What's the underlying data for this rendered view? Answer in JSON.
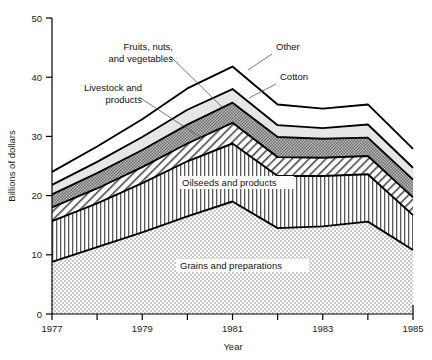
{
  "chart_data": {
    "type": "area",
    "stacked": true,
    "title": "",
    "subtitle": "",
    "xlabel": "Year",
    "ylabel": "Billions of dollars",
    "xlim": [
      1977,
      1985
    ],
    "ylim": [
      0,
      50
    ],
    "ytick_labels": [
      "0",
      "10",
      "20",
      "30",
      "40",
      "50"
    ],
    "ytick_values": [
      0,
      10,
      20,
      30,
      40,
      50
    ],
    "xtick_labels": [
      "1977",
      "",
      "1979",
      "",
      "1981",
      "",
      "1983",
      "",
      "1985"
    ],
    "xtick_values": [
      1977,
      1978,
      1979,
      1980,
      1981,
      1982,
      1983,
      1984,
      1985
    ],
    "xtick_labels_shown": [
      "1977",
      "1979",
      "1981",
      "1983",
      "1985"
    ],
    "grid": false,
    "legend": "inline-annotations",
    "x": [
      1977,
      1978,
      1979,
      1980,
      1981,
      1982,
      1983,
      1984,
      1985
    ],
    "series": [
      {
        "name": "Grains and preparations",
        "pattern": "light-stipple",
        "color": "#d2d2d2",
        "values": [
          8.8,
          11.3,
          13.8,
          16.5,
          19.0,
          14.5,
          14.8,
          15.6,
          10.8
        ]
      },
      {
        "name": "Oilseeds and products",
        "pattern": "vertical-lines",
        "color": "#ffffff",
        "values": [
          6.9,
          7.4,
          8.3,
          9.3,
          9.8,
          8.8,
          8.5,
          8.0,
          5.9
        ]
      },
      {
        "name": "Livestock and products",
        "pattern": "diagonal-hatch",
        "color": "#ffffff",
        "values": [
          2.3,
          2.5,
          2.7,
          3.0,
          3.5,
          3.2,
          3.1,
          3.1,
          3.0
        ]
      },
      {
        "name": "Fruits, nuts, and vegetables",
        "pattern": "dark-checker",
        "color": "#8f8f8f",
        "values": [
          2.2,
          2.6,
          2.9,
          3.2,
          3.4,
          3.4,
          3.2,
          3.1,
          3.0
        ]
      },
      {
        "name": "Cotton",
        "pattern": "light-gray",
        "color": "#e2e2e2",
        "values": [
          1.6,
          1.9,
          2.2,
          2.5,
          2.3,
          2.0,
          1.8,
          2.2,
          2.0
        ]
      },
      {
        "name": "Other",
        "pattern": "white",
        "color": "#ffffff",
        "values": [
          2.2,
          2.6,
          3.0,
          3.6,
          3.8,
          3.5,
          3.3,
          3.4,
          3.2
        ]
      }
    ],
    "totals": [
      24.0,
      28.3,
      32.9,
      38.1,
      41.8,
      35.4,
      34.7,
      35.4,
      27.9
    ],
    "annotations": [
      {
        "id": "fruits-nuts-vegetables",
        "text_lines": [
          "Fruits, nuts,",
          "and vegetables"
        ],
        "placement": "outside-left"
      },
      {
        "id": "livestock-and-products",
        "text_lines": [
          "Livestock and",
          "products"
        ],
        "placement": "outside-left"
      },
      {
        "id": "other",
        "text_lines": [
          "Other"
        ],
        "placement": "outside-right"
      },
      {
        "id": "cotton",
        "text_lines": [
          "Cotton"
        ],
        "placement": "outside-right"
      },
      {
        "id": "oilseeds-and-products",
        "text_lines": [
          "Oilseeds and products"
        ],
        "placement": "inside"
      },
      {
        "id": "grains-and-preparations",
        "text_lines": [
          "Grains and preparations"
        ],
        "placement": "inside"
      }
    ]
  },
  "labels": {
    "y_axis_title": "Billions of dollars",
    "x_axis_title": "Year",
    "fruits_line1": "Fruits, nuts,",
    "fruits_line2": "and vegetables",
    "livestock_line1": "Livestock and",
    "livestock_line2": "products",
    "other": "Other",
    "cotton": "Cotton",
    "oilseeds": "Oilseeds and products",
    "grains": "Grains and preparations",
    "y_0": "0",
    "y_10": "10",
    "y_20": "20",
    "y_30": "30",
    "y_40": "40",
    "y_50": "50",
    "x_1977": "1977",
    "x_1979": "1979",
    "x_1981": "1981",
    "x_1983": "1983",
    "x_1985": "1985"
  }
}
